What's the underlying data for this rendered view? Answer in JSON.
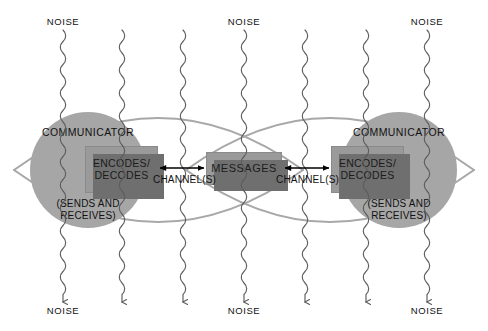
{
  "diagram": {
    "palette": {
      "background": "#ffffff",
      "lens_stroke": "#a8a8a8",
      "circle_fill": "#a6a6a6",
      "box_fill": "#9a9a9a",
      "box_shadow": "#6f6f6f",
      "text": "#111111",
      "noise_stroke": "#5c5c5c",
      "arrow": "#000000"
    },
    "noise_labels": {
      "text": "NOISE",
      "top": [
        {
          "text": "NOISE",
          "x": 63,
          "y": 22
        },
        {
          "text": "NOISE",
          "x": 244,
          "y": 22
        },
        {
          "text": "NOISE",
          "x": 427,
          "y": 22
        }
      ],
      "bottom": [
        {
          "text": "NOISE",
          "x": 63,
          "y": 313
        },
        {
          "text": "NOISE",
          "x": 244,
          "y": 313
        },
        {
          "text": "NOISE",
          "x": 427,
          "y": 313
        }
      ]
    },
    "noise_lines_x": [
      63,
      122,
      183,
      244,
      305,
      366,
      427
    ],
    "communicators": [
      {
        "side": "left",
        "label": "COMMUNICATOR",
        "sublabel_line1": "(SENDS AND",
        "sublabel_line2": "RECEIVES)",
        "box_line1": "ENCODES/",
        "box_line2": "DECODES",
        "circle": {
          "cx": 88,
          "cy": 170,
          "r": 58
        },
        "box": {
          "x": 85,
          "y": 146,
          "w": 73,
          "h": 47
        }
      },
      {
        "side": "right",
        "label": "COMMUNICATOR",
        "sublabel_line1": "(SENDS AND",
        "sublabel_line2": "RECEIVES)",
        "box_line1": "ENCODES/",
        "box_line2": "DECODES",
        "circle": {
          "cx": 399,
          "cy": 170,
          "r": 58
        },
        "box": {
          "x": 331,
          "y": 146,
          "w": 73,
          "h": 47
        }
      }
    ],
    "messages": {
      "label": "MESSAGES",
      "box": {
        "x": 206,
        "y": 152,
        "w": 76,
        "h": 33
      }
    },
    "channels": [
      {
        "label": "CHANNEL(S)",
        "x": 183,
        "y": 181,
        "arrow_y": 168,
        "x1": 160,
        "x2": 204
      },
      {
        "label": "CHANNEL(S)",
        "x": 328,
        "y": 181,
        "arrow_y": 168,
        "x1": 285,
        "x2": 329
      }
    ],
    "lenses": [
      {
        "side": "left",
        "tip_left_x": 14,
        "tip_right_x": 303,
        "tip_y": 170,
        "top_y": 78,
        "bottom_y": 262
      },
      {
        "side": "right",
        "tip_left_x": 186,
        "tip_right_x": 474,
        "tip_y": 170,
        "top_y": 78,
        "bottom_y": 262
      }
    ]
  }
}
